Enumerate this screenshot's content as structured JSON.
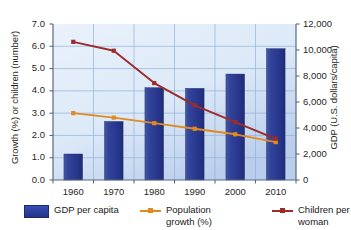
{
  "chart_data": {
    "type": "bar",
    "title": "",
    "subtitle": "",
    "categories": [
      "1960",
      "1970",
      "1980",
      "1990",
      "2000",
      "2010"
    ],
    "xlabel": "",
    "grid": true,
    "legend_position": "bottom",
    "axes": {
      "left": {
        "label": "Growth (%) or children (number)",
        "ticks": [
          "0.0",
          "1.0",
          "2.0",
          "3.0",
          "4.0",
          "5.0",
          "6.0",
          "7.0"
        ],
        "min": 0,
        "max": 7,
        "step": 1
      },
      "right": {
        "label": "GDP (U.S. dollars/capita)",
        "ticks": [
          "0",
          "2,000",
          "4,000",
          "6,000",
          "8,000",
          "10,000",
          "12,000"
        ],
        "min": 0,
        "max": 12000,
        "step": 2000
      }
    },
    "series": [
      {
        "name": "GDP per capita",
        "kind": "bar",
        "axis": "right",
        "color": "#2c3f9e",
        "values": [
          2000,
          4500,
          7100,
          7050,
          8150,
          10100
        ]
      },
      {
        "name": "Population growth (%)",
        "kind": "line",
        "axis": "left",
        "color": "#e08a20",
        "values": [
          3.0,
          2.8,
          2.55,
          2.3,
          2.05,
          1.7
        ]
      },
      {
        "name": "Children per woman",
        "kind": "line",
        "axis": "left",
        "color": "#9e2b2b",
        "values": [
          6.2,
          5.8,
          4.35,
          3.35,
          2.6,
          1.85
        ]
      }
    ]
  },
  "legend": {
    "gdp_label": "GDP per capita",
    "population_label": "Population growth (%)",
    "children_label": "Children per woman"
  }
}
